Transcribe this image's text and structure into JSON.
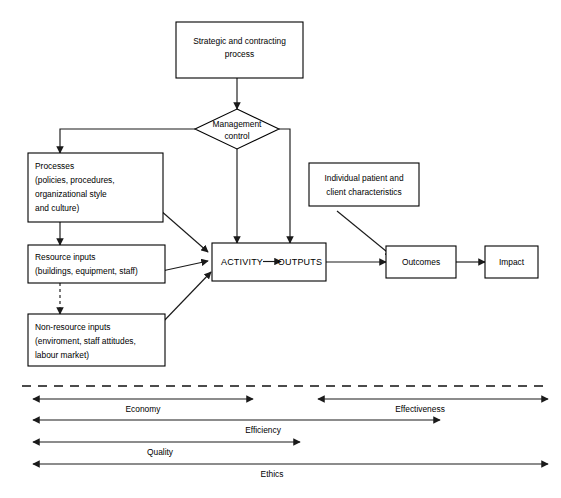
{
  "diagram": {
    "colors": {
      "background": "#ffffff",
      "stroke": "#000000",
      "connector": "#1a1a1a"
    },
    "nodes": {
      "strategic": {
        "shape": "rectangle",
        "lines": [
          "Strategic and contracting",
          "process"
        ]
      },
      "management_control": {
        "shape": "diamond",
        "lines": [
          "Management",
          "control"
        ]
      },
      "processes": {
        "shape": "rectangle",
        "lines": [
          "Processes",
          "(policies, procedures,",
          "organizational style",
          "and culture)"
        ]
      },
      "resource_inputs": {
        "shape": "rectangle",
        "lines": [
          "Resource inputs",
          "(buildings, equipment, staff)"
        ]
      },
      "non_resource_inputs": {
        "shape": "rectangle",
        "lines": [
          "Non-resource inputs",
          "(enviroment, staff attitudes,",
          "labour market)"
        ]
      },
      "individual_patient": {
        "shape": "rectangle",
        "lines": [
          "Individual patient and",
          "client characteristics"
        ]
      },
      "activity": {
        "shape": "rectangle",
        "activity_label": "ACTIVITY",
        "outputs_label": "OUTPUTS"
      },
      "outcomes": {
        "shape": "rectangle",
        "lines": [
          "Outcomes"
        ]
      },
      "impact": {
        "shape": "rectangle",
        "lines": [
          "Impact"
        ]
      }
    },
    "measures": [
      {
        "id": "economy",
        "label": "Economy",
        "row": 1,
        "x1": 33,
        "x2": 253,
        "label_x": 143
      },
      {
        "id": "effectiveness",
        "label": "Effectiveness",
        "row": 1,
        "x1": 318,
        "x2": 548,
        "label_x": 420
      },
      {
        "id": "efficiency",
        "label": "Efficiency",
        "row": 2,
        "x1": 33,
        "x2": 440,
        "label_x": 263
      },
      {
        "id": "quality",
        "label": "Quality",
        "row": 3,
        "x1": 33,
        "x2": 300,
        "label_x": 160
      },
      {
        "id": "ethics",
        "label": "Ethics",
        "row": 4,
        "x1": 33,
        "x2": 548,
        "label_x": 272
      }
    ]
  }
}
